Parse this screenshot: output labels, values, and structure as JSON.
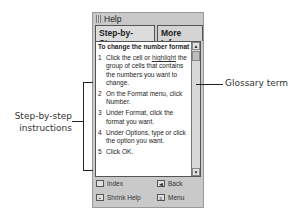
{
  "window": {
    "title": "Help",
    "tabs": [
      {
        "label": "Step-by-Step",
        "active": true
      },
      {
        "label": "More Info",
        "active": false
      }
    ]
  },
  "content": {
    "heading": "To change the number format",
    "steps": [
      {
        "num": "1",
        "pre": "Click the cell or ",
        "glossary": "highlight",
        "post": " the group of cells that contains the numbers you want to change."
      },
      {
        "num": "2",
        "text": "On the Format menu, click Number."
      },
      {
        "num": "3",
        "text": "Under Format, click the format you want."
      },
      {
        "num": "4",
        "text": "Under Options, type or click the option you want."
      },
      {
        "num": "5",
        "text": "Click OK."
      }
    ]
  },
  "footer": {
    "index": {
      "label": "Index",
      "icon": "index-icon"
    },
    "back": {
      "label": "Back",
      "icon": "back-arrow-icon"
    },
    "shrink": {
      "label": "Shrink Help",
      "icon": "shrink-icon"
    },
    "menu": {
      "label": "Menu",
      "icon": "menu-icon"
    }
  },
  "annotations": {
    "glossary": "Glossary term",
    "steps_line1": "Step-by-step",
    "steps_line2": "instructions"
  }
}
